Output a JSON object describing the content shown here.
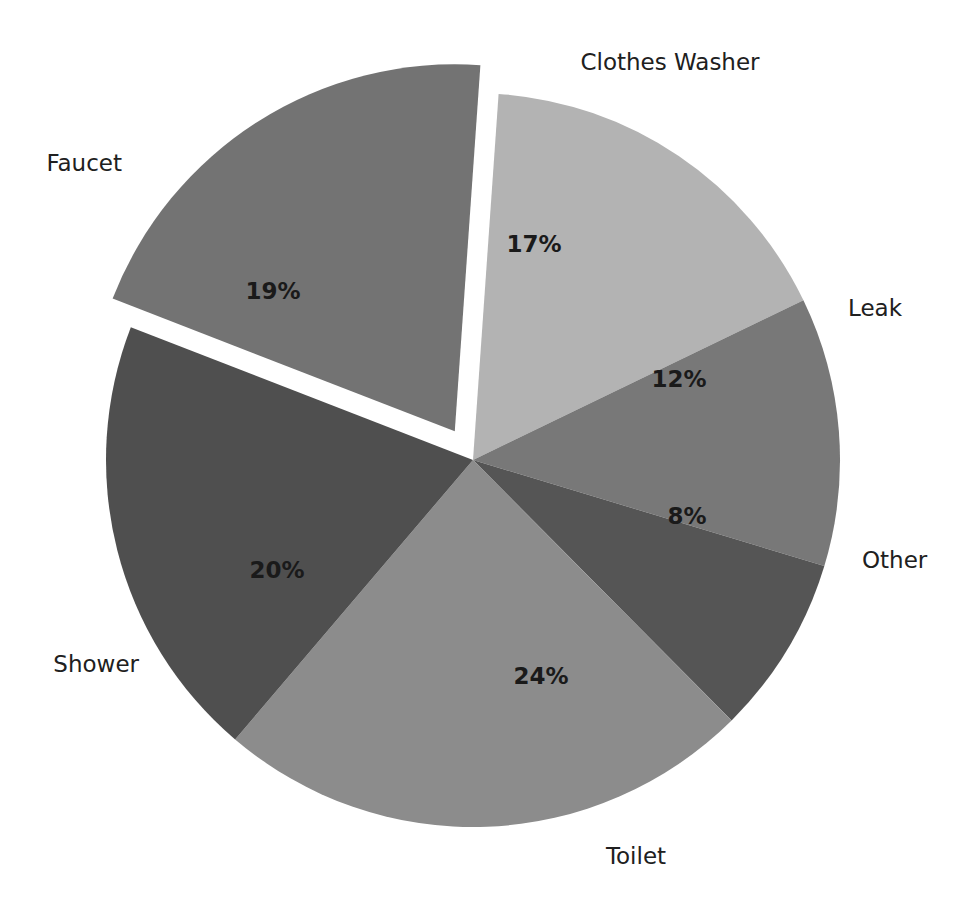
{
  "chart_data": {
    "type": "pie",
    "title": "",
    "subtitle": "",
    "xlabel": "",
    "ylabel": "",
    "unit": "%",
    "legend_position": "none",
    "grid": false,
    "labels_inside": true,
    "categories": [
      "Clothes Washer",
      "Leak",
      "Other",
      "Toilet",
      "Shower",
      "Faucet"
    ],
    "values": [
      17,
      12,
      8,
      24,
      20,
      19
    ],
    "value_labels": [
      "17%",
      "12%",
      "8%",
      "24%",
      "20%",
      "19%"
    ],
    "colors": [
      "#b3b3b3",
      "#787878",
      "#555555",
      "#8c8c8c",
      "#4f4f4f",
      "#737373"
    ],
    "exploded": [
      "Faucet"
    ],
    "slices": [
      {
        "name": "Clothes Washer",
        "value": 17,
        "value_label": "17%",
        "color": "#b3b3b3",
        "start_angle": -86,
        "end_angle": -25.8,
        "exploded": false,
        "pct_label_x": 534,
        "pct_label_y": 245,
        "cat_label_x": 670,
        "cat_label_y": 63,
        "cat_anchor": "middle"
      },
      {
        "name": "Leak",
        "value": 12,
        "value_label": "12%",
        "color": "#787878",
        "start_angle": -25.8,
        "end_angle": 16.8,
        "exploded": false,
        "pct_label_x": 679,
        "pct_label_y": 380,
        "cat_label_x": 848,
        "cat_label_y": 309,
        "cat_anchor": "start"
      },
      {
        "name": "Other",
        "value": 8,
        "value_label": "8%",
        "color": "#555555",
        "start_angle": 16.8,
        "end_angle": 45.2,
        "exploded": false,
        "pct_label_x": 687,
        "pct_label_y": 517,
        "cat_label_x": 862,
        "cat_label_y": 561,
        "cat_anchor": "start"
      },
      {
        "name": "Toilet",
        "value": 24,
        "value_label": "24%",
        "color": "#8c8c8c",
        "start_angle": 45.2,
        "end_angle": 130.4,
        "exploded": false,
        "pct_label_x": 541,
        "pct_label_y": 677,
        "cat_label_x": 636,
        "cat_label_y": 857,
        "cat_anchor": "middle"
      },
      {
        "name": "Shower",
        "value": 20,
        "value_label": "20%",
        "color": "#4f4f4f",
        "start_angle": 130.4,
        "end_angle": 201.2,
        "exploded": false,
        "pct_label_x": 277,
        "pct_label_y": 571,
        "cat_label_x": 139,
        "cat_label_y": 665,
        "cat_anchor": "end"
      },
      {
        "name": "Faucet",
        "value": 19,
        "value_label": "19%",
        "color": "#737373",
        "start_angle": 201.2,
        "end_angle": 274,
        "exploded": true,
        "pct_label_x": 273,
        "pct_label_y": 292,
        "cat_label_x": 122,
        "cat_label_y": 164,
        "cat_anchor": "end"
      }
    ],
    "geometry": {
      "center_x": 473,
      "center_y": 460,
      "radius": 367,
      "explode_offset": 34
    },
    "background_color": "#ffffff",
    "text_color": "#202020"
  }
}
